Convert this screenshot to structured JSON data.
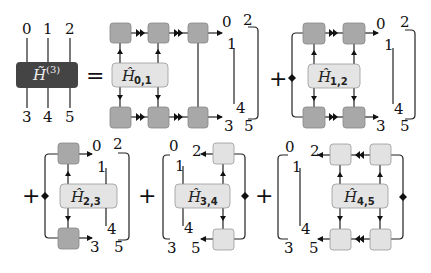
{
  "colors": {
    "mpo_box": "#444444",
    "tensor_dark": "#a8a8a8",
    "tensor_light": "#e2e2e2",
    "h_box": "#e4e4e4",
    "line": "#222222"
  },
  "lhs": {
    "label": "H̃",
    "superscript": "(3)",
    "top_indices": [
      "0",
      "1",
      "2"
    ],
    "bottom_indices": [
      "3",
      "4",
      "5"
    ],
    "equals": "="
  },
  "terms": [
    {
      "op": "",
      "h_label": "Ĥ",
      "h_sub": "0,1",
      "idx": {
        "0": "0",
        "1": "1",
        "2": "2",
        "3": "3",
        "4": "4",
        "5": "5"
      }
    },
    {
      "op": "+",
      "h_label": "Ĥ",
      "h_sub": "1,2",
      "idx": {
        "0": "0",
        "1": "1",
        "2": "2",
        "3": "3",
        "4": "4",
        "5": "5"
      }
    },
    {
      "op": "+",
      "h_label": "Ĥ",
      "h_sub": "2,3",
      "idx": {
        "0": "0",
        "1": "1",
        "2": "2",
        "3": "3",
        "4": "4",
        "5": "5"
      }
    },
    {
      "op": "+",
      "h_label": "Ĥ",
      "h_sub": "3,4",
      "idx": {
        "0": "0",
        "1": "1",
        "2": "2",
        "3": "3",
        "4": "4",
        "5": "5"
      }
    },
    {
      "op": "+",
      "h_label": "Ĥ",
      "h_sub": "4,5",
      "idx": {
        "0": "0",
        "1": "1",
        "2": "2",
        "3": "3",
        "4": "4",
        "5": "5"
      }
    }
  ]
}
